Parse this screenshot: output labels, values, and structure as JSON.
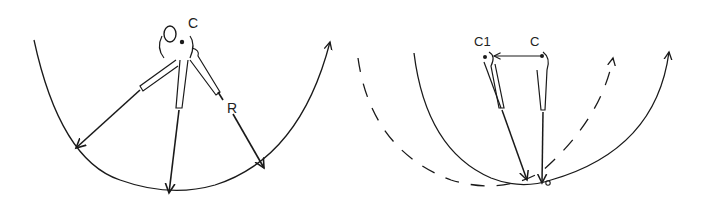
{
  "diagram": {
    "left": {
      "labels": {
        "center": "C",
        "radius": "R",
        "head": "O"
      }
    },
    "right": {
      "labels": {
        "shifted_center": "C1",
        "center": "C"
      }
    },
    "colors": {
      "line": "#1a1a1a",
      "background": "#ffffff"
    }
  }
}
